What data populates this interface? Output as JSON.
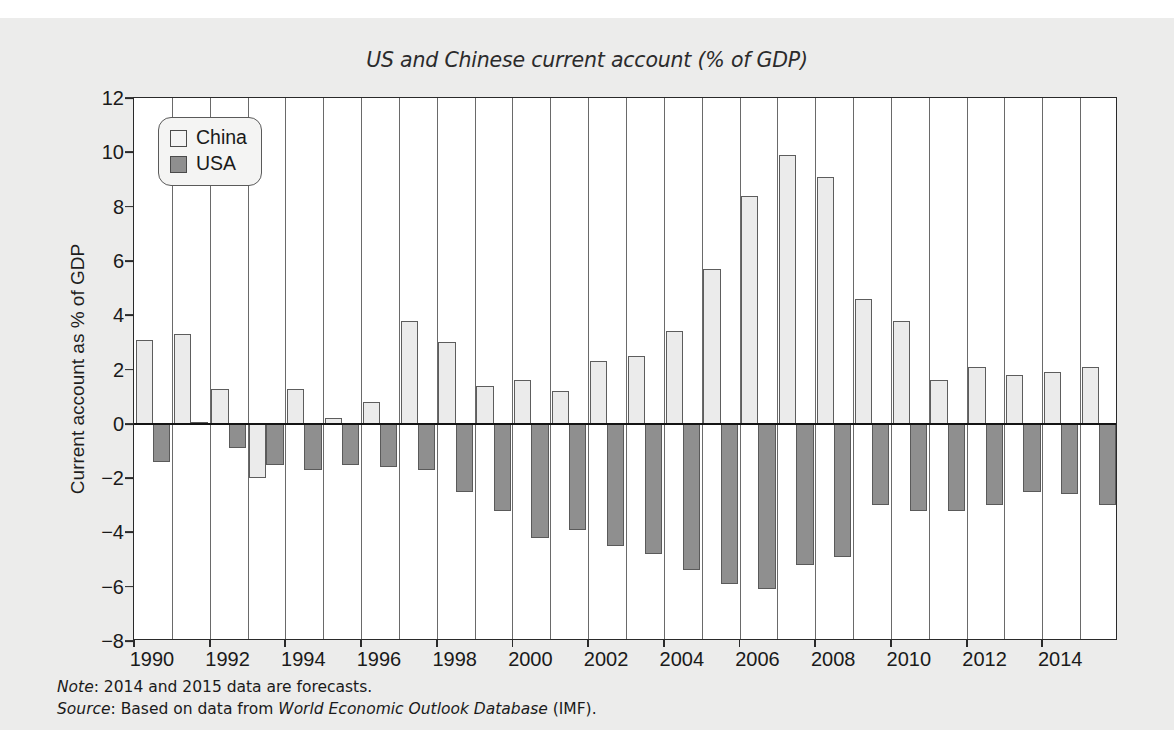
{
  "chart_data": {
    "type": "bar",
    "title": "US and Chinese current account (% of GDP)",
    "xlabel": "",
    "ylabel": "Current account as % of GDP",
    "ylim": [
      -8,
      12
    ],
    "ytick_values": [
      12,
      10,
      8,
      6,
      4,
      2,
      0,
      -2,
      -4,
      -6,
      -8
    ],
    "ytick_labels": [
      "12",
      "10",
      "8",
      "6",
      "4",
      "2",
      "0",
      "−2",
      "−4",
      "−6",
      "−8"
    ],
    "grid": "vertical",
    "legend_position": "top-left",
    "categories": [
      "1990",
      "1991",
      "1992",
      "1993",
      "1994",
      "1995",
      "1996",
      "1997",
      "1998",
      "1999",
      "2000",
      "2001",
      "2002",
      "2003",
      "2004",
      "2005",
      "2006",
      "2007",
      "2008",
      "2009",
      "2010",
      "2011",
      "2012",
      "2013",
      "2014",
      "2015"
    ],
    "xtick_labels": [
      "1990",
      "1992",
      "1994",
      "1996",
      "1998",
      "2000",
      "2002",
      "2004",
      "2006",
      "2008",
      "2010",
      "2012",
      "2014"
    ],
    "series": [
      {
        "name": "China",
        "color": "#ebebeb",
        "values": [
          3.1,
          3.3,
          1.3,
          -2.0,
          1.3,
          0.2,
          0.8,
          3.8,
          3.0,
          1.4,
          1.6,
          1.2,
          2.3,
          2.5,
          3.4,
          5.7,
          8.4,
          9.9,
          9.1,
          4.6,
          3.8,
          1.6,
          2.1,
          1.8,
          1.9,
          2.1
        ]
      },
      {
        "name": "USA",
        "color": "#8f8f8f",
        "values": [
          -1.4,
          0.05,
          -0.9,
          -1.5,
          -1.7,
          -1.5,
          -1.6,
          -1.7,
          -2.5,
          -3.2,
          -4.2,
          -3.9,
          -4.5,
          -4.8,
          -5.4,
          -5.9,
          -6.1,
          -5.2,
          -4.9,
          -3.0,
          -3.2,
          -3.2,
          -3.0,
          -2.5,
          -2.6,
          -3.0
        ]
      }
    ]
  },
  "legend": {
    "items": [
      {
        "label": "China",
        "swatch": "china"
      },
      {
        "label": "USA",
        "swatch": "usa"
      }
    ]
  },
  "footnotes": {
    "note_label": "Note",
    "note_text": ": 2014 and 2015 data are forecasts.",
    "source_label": "Source",
    "source_prefix": ": Based on data from ",
    "source_italic": "World Economic Outlook Database",
    "source_suffix": " (IMF)."
  }
}
